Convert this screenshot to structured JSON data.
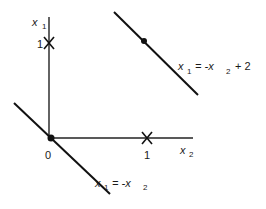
{
  "diagram": {
    "axes": {
      "vertical_label": "x",
      "vertical_sub": "1",
      "horizontal_label": "x",
      "horizontal_sub": "2",
      "origin_label": "0"
    },
    "ticks": {
      "vertical_tick_label": "1",
      "horizontal_tick_label": "1"
    },
    "lines": [
      {
        "name": "upper-line",
        "eq_lhs": "x",
        "eq_lhs_sub": "1",
        "eq_mid": "= -x",
        "eq_rhs_sub": "2",
        "eq_tail": "+ 2"
      },
      {
        "name": "lower-line",
        "eq_lhs": "x",
        "eq_lhs_sub": "1",
        "eq_mid": "= -x",
        "eq_rhs_sub": "2",
        "eq_tail": ""
      }
    ],
    "colors": {
      "stroke": "#111111",
      "background": "#ffffff"
    }
  }
}
